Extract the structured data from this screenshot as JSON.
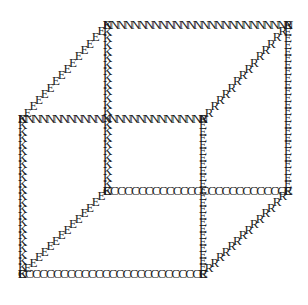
{
  "figure": {
    "type": "ascii-art-wireframe",
    "canvas": {
      "width": 308,
      "height": 305
    },
    "background_color": "#ffffff",
    "glyph_color": "#1a1a1a",
    "glyph_font_size": 13,
    "legend": {
      "N": "back / top horizontal edges",
      "K": "left and middle vertical edges",
      "E": "right vertical edges and left depth diagonals",
      "R": "right depth diagonals",
      "C": "front / bottom horizontal edges"
    }
  },
  "vertices": {
    "front_bottom_left": {
      "x": 22,
      "y": 275
    },
    "front_bottom_right": {
      "x": 203,
      "y": 275
    },
    "front_top_left": {
      "x": 22,
      "y": 120
    },
    "front_top_right": {
      "x": 203,
      "y": 120
    },
    "back_bottom_left": {
      "x": 107,
      "y": 192
    },
    "back_bottom_right": {
      "x": 288,
      "y": 192
    },
    "back_top_left": {
      "x": 107,
      "y": 26
    },
    "back_top_right": {
      "x": 288,
      "y": 26
    }
  },
  "edges": [
    {
      "name": "back-top-horizontal",
      "letter": "N",
      "from": "back_top_left",
      "to": "back_top_right",
      "count": 27
    },
    {
      "name": "front-top-horizontal",
      "letter": "N",
      "from": "front_top_left",
      "to": "front_top_right",
      "count": 27
    },
    {
      "name": "front-bottom-horizontal",
      "letter": "C",
      "from": "front_bottom_left",
      "to": "front_bottom_right",
      "count": 27
    },
    {
      "name": "back-bottom-horizontal",
      "letter": "C",
      "from": "back_bottom_left",
      "to": "back_bottom_right",
      "count": 27
    },
    {
      "name": "front-left-vertical",
      "letter": "K",
      "from": "front_top_left",
      "to": "front_bottom_left",
      "count": 25
    },
    {
      "name": "back-left-vertical",
      "letter": "K",
      "from": "back_top_left",
      "to": "back_bottom_left",
      "count": 26
    },
    {
      "name": "front-right-vertical",
      "letter": "E",
      "from": "front_top_right",
      "to": "front_bottom_right",
      "count": 25
    },
    {
      "name": "back-right-vertical",
      "letter": "E",
      "from": "back_top_right",
      "to": "back_bottom_right",
      "count": 26
    },
    {
      "name": "left-top-depth-diagonal",
      "letter": "E",
      "from": "front_top_left",
      "to": "back_top_left",
      "count": 16
    },
    {
      "name": "left-bottom-depth-diagonal",
      "letter": "E",
      "from": "front_bottom_left",
      "to": "back_bottom_left",
      "count": 16
    },
    {
      "name": "right-top-depth-diagonal",
      "letter": "R",
      "from": "front_top_right",
      "to": "back_top_right",
      "count": 16
    },
    {
      "name": "right-bottom-depth-diagonal",
      "letter": "R",
      "from": "front_bottom_right",
      "to": "back_bottom_right",
      "count": 16
    }
  ]
}
